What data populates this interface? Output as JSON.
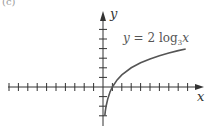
{
  "panel_label": "(c)",
  "chart_data": {
    "type": "line",
    "title": "",
    "equation": "y = 2 log3 x",
    "equation_parts": {
      "lhs": "y",
      "eq": " = 2 log",
      "base": "3",
      "var": "x"
    },
    "xlabel": "x",
    "ylabel": "y",
    "xlim": [
      -10,
      10
    ],
    "ylim": [
      -3.5,
      6.5
    ],
    "x_ticks": [
      -10,
      -9,
      -8,
      -7,
      -6,
      -5,
      -4,
      -3,
      -2,
      -1,
      1,
      2,
      3,
      4,
      5,
      6,
      7,
      8,
      9
    ],
    "y_ticks": [
      -3,
      -2,
      -1,
      1,
      2,
      3,
      4,
      5,
      6
    ],
    "grid": false,
    "series": [
      {
        "name": "y = 2 log3 x",
        "x": [
          0.19,
          0.25,
          0.33,
          0.5,
          0.75,
          1,
          1.5,
          2,
          3,
          4,
          5,
          6,
          7,
          8,
          8.8
        ],
        "values": [
          -3.0,
          -2.52,
          -2.0,
          -1.26,
          -0.52,
          0,
          0.74,
          1.26,
          2.0,
          2.52,
          2.93,
          3.26,
          3.54,
          3.79,
          3.96
        ]
      }
    ],
    "colors": {
      "curve": "#555555",
      "axes": "#333333"
    }
  }
}
